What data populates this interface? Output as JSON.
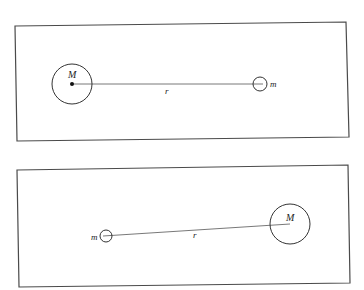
{
  "panels": [
    {
      "id": "top",
      "frame": {
        "x1": 15,
        "y1": 26,
        "x2": 346,
        "y2": 22,
        "x3": 349,
        "y3": 137,
        "x4": 17,
        "y4": 141
      },
      "large_mass": {
        "label": "M",
        "cx": 72,
        "cy": 84,
        "r": 20,
        "has_center_dot": true
      },
      "small_mass": {
        "label": "m",
        "cx": 260,
        "cy": 84,
        "r": 7
      },
      "separation": {
        "label": "r",
        "x1": 72,
        "y1": 84,
        "x2": 263,
        "y2": 84
      },
      "labels": {
        "M": {
          "text": "M",
          "x": 68,
          "y": 78
        },
        "m": {
          "text": "m",
          "x": 270,
          "y": 87
        },
        "r": {
          "text": "r",
          "x": 165,
          "y": 94
        }
      }
    },
    {
      "id": "bottom",
      "frame": {
        "x1": 17,
        "y1": 170,
        "x2": 348,
        "y2": 165,
        "x3": 350,
        "y3": 283,
        "x4": 19,
        "y4": 287
      },
      "large_mass": {
        "label": "M",
        "cx": 290,
        "cy": 224,
        "r": 20,
        "has_center_dot": false
      },
      "small_mass": {
        "label": "m",
        "cx": 106,
        "cy": 236,
        "r": 6
      },
      "separation": {
        "label": "r",
        "x1": 103,
        "y1": 236,
        "x2": 290,
        "y2": 224
      },
      "labels": {
        "M": {
          "text": "M",
          "x": 286,
          "y": 221
        },
        "m": {
          "text": "m",
          "x": 91,
          "y": 240
        },
        "r": {
          "text": "r",
          "x": 193,
          "y": 238
        }
      }
    }
  ]
}
